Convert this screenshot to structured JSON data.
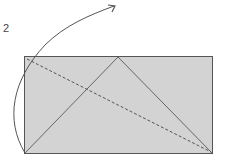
{
  "diagram": {
    "step_number": "2",
    "paper": {
      "fill": "#d3d3d3",
      "stroke": "#555555"
    },
    "colors": {
      "line": "#555555",
      "dashed": "#555555",
      "arrow": "#555555"
    }
  }
}
